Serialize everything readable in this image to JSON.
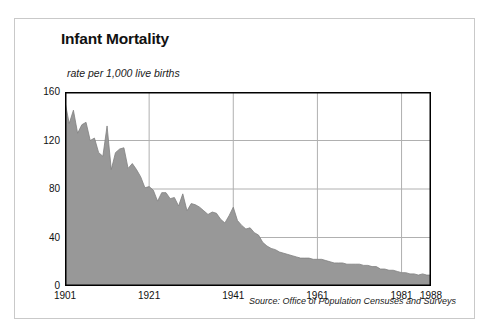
{
  "chart_data": {
    "type": "area",
    "title": "Infant Mortality",
    "subtitle": "rate per 1,000 live births",
    "xlabel": "",
    "ylabel": "rate per 1,000 live births",
    "source": "Source: Office of Population Censuses and Surveys",
    "grid": true,
    "legend": "none",
    "fill_color": "#989898",
    "line_color": "#808080",
    "axis_color": "#000000",
    "grid_color": "#b0b0b0",
    "border_color": "#c9c9c9",
    "xlim": [
      1901,
      1988
    ],
    "ylim": [
      0,
      160
    ],
    "yticks": [
      0,
      40,
      80,
      120,
      160
    ],
    "ytick_labels": [
      "0",
      "40",
      "80",
      "120",
      "160"
    ],
    "xticks": [
      1901,
      1921,
      1941,
      1961,
      1981,
      1988
    ],
    "xtick_labels": [
      "1901",
      "1921",
      "1941",
      "1961",
      "1981",
      "1988"
    ],
    "x": [
      1901,
      1902,
      1903,
      1904,
      1905,
      1906,
      1907,
      1908,
      1909,
      1910,
      1911,
      1912,
      1913,
      1914,
      1915,
      1916,
      1917,
      1918,
      1919,
      1920,
      1921,
      1922,
      1923,
      1924,
      1925,
      1926,
      1927,
      1928,
      1929,
      1930,
      1931,
      1932,
      1933,
      1934,
      1935,
      1936,
      1937,
      1938,
      1939,
      1940,
      1941,
      1942,
      1943,
      1944,
      1945,
      1946,
      1947,
      1948,
      1949,
      1950,
      1951,
      1952,
      1953,
      1954,
      1955,
      1956,
      1957,
      1958,
      1959,
      1960,
      1961,
      1962,
      1963,
      1964,
      1965,
      1966,
      1967,
      1968,
      1969,
      1970,
      1971,
      1972,
      1973,
      1974,
      1975,
      1976,
      1977,
      1978,
      1979,
      1980,
      1981,
      1982,
      1983,
      1984,
      1985,
      1986,
      1987,
      1988
    ],
    "values": [
      152,
      134,
      145,
      126,
      133,
      135,
      120,
      122,
      110,
      107,
      132,
      96,
      110,
      113,
      114,
      97,
      101,
      96,
      90,
      81,
      82,
      79,
      70,
      77,
      77,
      72,
      73,
      66,
      76,
      62,
      68,
      67,
      65,
      62,
      59,
      61,
      60,
      55,
      52,
      58,
      65,
      54,
      50,
      47,
      48,
      44,
      42,
      36,
      33,
      31,
      30,
      28,
      27,
      26,
      25,
      24,
      23,
      23,
      23,
      22,
      22,
      22,
      21,
      20,
      19,
      19,
      19,
      18,
      18,
      18,
      18,
      17,
      17,
      16,
      16,
      14,
      14,
      13,
      13,
      12,
      11,
      11,
      10,
      10,
      9,
      10,
      9,
      9
    ]
  },
  "figure": {
    "border_visible": true
  }
}
